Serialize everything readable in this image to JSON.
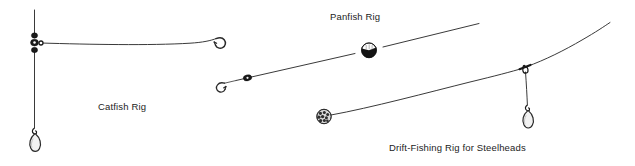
{
  "canvas": {
    "width": 635,
    "height": 166,
    "background": "#ffffff"
  },
  "palette": {
    "line": "#3a3a3a",
    "hook": "#2a2a2a",
    "hardware": "#1a1a1a",
    "text": "#1c1c1c",
    "float_top": "#fdfdfd",
    "float_bottom": "#141414"
  },
  "diagram": {
    "rigs": [
      {
        "id": "catfish-rig",
        "label": "Catfish Rig",
        "label_x": 98,
        "label_y": 110,
        "components": [
          {
            "name": "main-line",
            "type": "line"
          },
          {
            "name": "three-way-swivel",
            "type": "hardware"
          },
          {
            "name": "bead-upper",
            "type": "hardware"
          },
          {
            "name": "bead-lower",
            "type": "hardware"
          },
          {
            "name": "leader-line",
            "type": "line"
          },
          {
            "name": "baited-hook",
            "type": "hook"
          },
          {
            "name": "dropper-line",
            "type": "line"
          },
          {
            "name": "teardrop-sinker",
            "type": "sinker"
          }
        ]
      },
      {
        "id": "panfish-rig",
        "label": "Panfish Rig",
        "label_x": 330,
        "label_y": 20,
        "components": [
          {
            "name": "main-line",
            "type": "line"
          },
          {
            "name": "round-float",
            "type": "float"
          },
          {
            "name": "split-shot-sinker",
            "type": "sinker"
          },
          {
            "name": "small-hook",
            "type": "hook"
          }
        ]
      },
      {
        "id": "drift-fishing-rig",
        "label": "Drift-Fishing Rig for Steelheads",
        "label_x": 389,
        "label_y": 151,
        "components": [
          {
            "name": "main-line",
            "type": "line"
          },
          {
            "name": "spawn-sack-bait",
            "type": "bait"
          },
          {
            "name": "three-way-swivel",
            "type": "hardware"
          },
          {
            "name": "dropper-line",
            "type": "line"
          },
          {
            "name": "teardrop-sinker",
            "type": "sinker"
          }
        ]
      }
    ]
  }
}
